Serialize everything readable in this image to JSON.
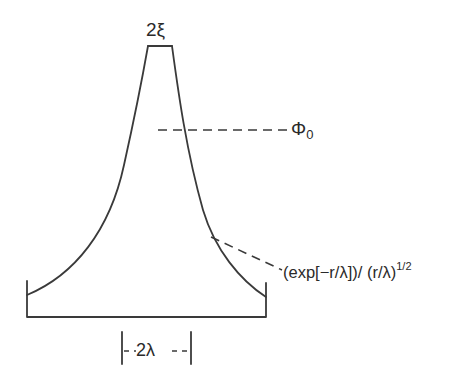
{
  "diagram": {
    "type": "vortex-profile",
    "labels": {
      "core_width": "2ξ",
      "flux": "Φ",
      "flux_subscript": "0",
      "decay_formula": "(exp[−r/λ])/ (r/λ)",
      "decay_exponent": "1/2",
      "penetration_width": "2λ"
    },
    "stroke_color": "#3a3a3a",
    "text_color": "#2a2a2a"
  }
}
